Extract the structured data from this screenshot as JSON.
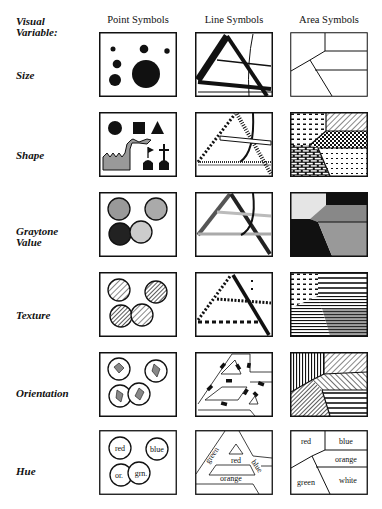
{
  "header": {
    "variable_label": [
      "Visual",
      "Variable:"
    ],
    "columns": [
      "Point Symbols",
      "Line Symbols",
      "Area Symbols"
    ]
  },
  "rows": [
    {
      "label": [
        "Size"
      ]
    },
    {
      "label": [
        "Shape"
      ]
    },
    {
      "label": [
        "Graytone",
        "Value"
      ]
    },
    {
      "label": [
        "Texture"
      ]
    },
    {
      "label": [
        "Orientation"
      ]
    },
    {
      "label": [
        "Hue"
      ]
    }
  ],
  "hue_labels": {
    "point": [
      "red",
      "blue",
      "or.",
      "grn."
    ],
    "line": [
      "green",
      "red",
      "blue",
      "orange"
    ],
    "area": [
      "red",
      "blue",
      "orange",
      "green",
      "white"
    ]
  },
  "colors": {
    "ink": "#111111",
    "gray_light": "#cfcfcf",
    "gray_mid": "#9a9a9a",
    "gray_dark": "#333333"
  }
}
